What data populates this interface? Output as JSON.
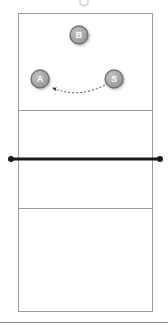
{
  "diagram": {
    "court": {
      "surface_color": "#ffffff",
      "line_color": "#9a9a9a",
      "outer_line_width": 1,
      "attack_line_width": 1,
      "left": 18,
      "top": 13,
      "right": 153,
      "bottom": 312,
      "attack_line_top_y": 110,
      "attack_line_bottom_y": 208
    },
    "net": {
      "name": "net",
      "color": "#1a1a1a",
      "thickness": 3,
      "y": 159,
      "left_post_x": 11,
      "right_post_x": 160,
      "post_radius": 3
    },
    "footer_rule": {
      "color": "#8c8c8c",
      "y": 322,
      "thickness": 1
    },
    "top_marker": {
      "name": "clipped-top-marker",
      "x": 84,
      "y": 2,
      "color": "#c9c9c9"
    },
    "players": [
      {
        "id": "B",
        "label": "B",
        "role": "blocker",
        "cx": 79,
        "cy": 35,
        "r": 9,
        "fill": "#a6a6a6",
        "stroke": "#6e6e6e",
        "text_color": "#ffffff"
      },
      {
        "id": "A",
        "label": "A",
        "role": "attacker",
        "cx": 40,
        "cy": 79,
        "r": 9,
        "fill": "#a6a6a6",
        "stroke": "#6e6e6e",
        "text_color": "#ffffff"
      },
      {
        "id": "S",
        "label": "S",
        "role": "setter",
        "cx": 114,
        "cy": 79,
        "r": 9,
        "fill": "#a6a6a6",
        "stroke": "#6e6e6e",
        "text_color": "#ffffff"
      }
    ],
    "ball_path": {
      "name": "ball-path-setter-to-attacker",
      "style": "dashed",
      "color": "#4a4a4a",
      "dash": "2,2",
      "thickness": 1,
      "from": "S",
      "to": "A",
      "start_x": 105,
      "start_y": 85,
      "control_x": 78,
      "control_y": 97,
      "end_x": 53,
      "end_y": 88,
      "arrowhead_at": "A"
    }
  }
}
